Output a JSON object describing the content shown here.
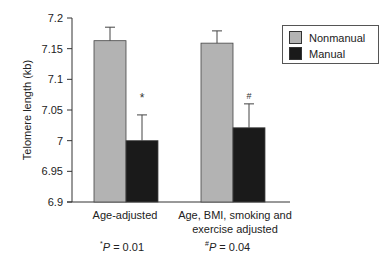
{
  "chart_data": {
    "type": "bar",
    "title": "",
    "xlabel": "",
    "ylabel": "Telomere length (kb)",
    "ylim": [
      6.9,
      7.2
    ],
    "yticks": [
      6.9,
      6.95,
      7,
      7.05,
      7.1,
      7.15,
      7.2
    ],
    "ytick_labels": [
      "6.9",
      "6.95",
      "7",
      "7.05",
      "7.1",
      "7.15",
      "7.2"
    ],
    "grid": false,
    "legend_position": "upper right",
    "categories": [
      "Age-adjusted",
      "Age, BMI, smoking and exercise adjusted"
    ],
    "category_lines": [
      [
        "Age-adjusted"
      ],
      [
        "Age, BMI, smoking and",
        "exercise adjusted"
      ]
    ],
    "series": [
      {
        "name": "Nonmanual",
        "color": "#b3b3b3",
        "values": [
          7.163,
          7.159
        ],
        "error": [
          0.022,
          0.02
        ]
      },
      {
        "name": "Manual",
        "color": "#1a1a1a",
        "values": [
          7.0,
          7.021
        ],
        "error": [
          0.042,
          0.039
        ]
      }
    ],
    "annotations": [
      {
        "category": 0,
        "symbol": "*",
        "y": 7.07
      },
      {
        "category": 1,
        "symbol": "#",
        "y": 7.075
      }
    ],
    "p_values": [
      {
        "symbol": "*",
        "label": "P",
        "text": " = 0.01"
      },
      {
        "symbol": "#",
        "label": "P",
        "text": " = 0.04"
      }
    ]
  }
}
